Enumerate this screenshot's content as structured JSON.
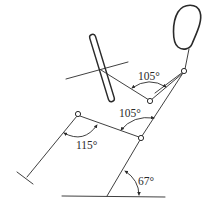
{
  "figure": {
    "type": "driver-posture-diagram",
    "colors": {
      "line": "#2a2a2a",
      "background": "#ffffff"
    }
  },
  "angles": [
    {
      "id": "elbow",
      "label": "105°",
      "value": 105
    },
    {
      "id": "torso-thigh",
      "label": "105°",
      "value": 105
    },
    {
      "id": "knee",
      "label": "115°",
      "value": 115
    },
    {
      "id": "seatback-floor",
      "label": "67°",
      "value": 67
    }
  ],
  "parts": [
    "head",
    "neck",
    "shoulder",
    "upper-arm",
    "elbow",
    "forearm",
    "steering-wheel",
    "steering-column",
    "torso",
    "hip",
    "thigh",
    "knee",
    "shin",
    "foot",
    "seat-back-line",
    "floor"
  ]
}
